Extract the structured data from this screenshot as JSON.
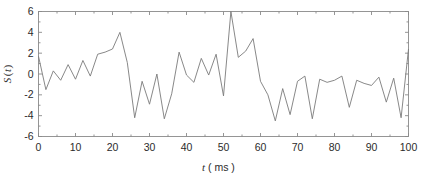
{
  "chart_data": {
    "type": "line",
    "title": "",
    "xlabel": "t ( ms )",
    "ylabel": "S ( t )",
    "xlabel_italic": "t",
    "xlabel_unit": "( ms )",
    "ylabel_italic_s": "S",
    "ylabel_italic_t": "t",
    "xlim": [
      0,
      100
    ],
    "ylim": [
      -6,
      6
    ],
    "xticks": [
      0,
      10,
      20,
      30,
      40,
      50,
      60,
      70,
      80,
      90,
      100
    ],
    "xticklabels": [
      "0",
      "10",
      "20",
      "30",
      "40",
      "50",
      "60",
      "70",
      "80",
      "90",
      "100"
    ],
    "xminorticks": [
      5,
      15,
      25,
      35,
      45,
      55,
      65,
      75,
      85,
      95
    ],
    "yticks": [
      -6,
      -4,
      -2,
      0,
      2,
      4,
      6
    ],
    "yticklabels": [
      "-6",
      "-4",
      "-2",
      "0",
      "2",
      "4",
      "6"
    ],
    "grid": false,
    "legend": null,
    "line_color": "#7a7a7a",
    "axis_color": "#8a8a8a",
    "background_color": "#ffffff",
    "series": [
      {
        "name": "S(t)",
        "x": [
          0,
          2,
          4,
          6,
          8,
          10,
          12,
          14,
          16,
          18,
          20,
          22,
          24,
          26,
          28,
          30,
          32,
          34,
          36,
          38,
          40,
          42,
          44,
          46,
          48,
          50,
          52,
          54,
          56,
          58,
          60,
          62,
          64,
          66,
          68,
          70,
          72,
          74,
          76,
          78,
          80,
          82,
          84,
          86,
          88,
          90,
          92,
          94,
          96,
          98,
          100
        ],
        "values": [
          1.7,
          -1.5,
          0.3,
          -0.6,
          0.9,
          -0.5,
          1.3,
          -0.2,
          1.9,
          2.1,
          2.4,
          4.0,
          1.1,
          -4.2,
          -0.7,
          -2.9,
          0.0,
          -4.3,
          -1.9,
          2.1,
          -0.1,
          -0.8,
          1.5,
          -0.1,
          1.9,
          -2.1,
          6.0,
          1.6,
          2.2,
          3.4,
          -0.7,
          -2.0,
          -4.5,
          -1.4,
          -3.9,
          -0.7,
          -0.2,
          -4.3,
          -0.5,
          -0.8,
          -0.6,
          -0.2,
          -3.2,
          -0.6,
          -0.9,
          -1.1,
          -0.3,
          -2.7,
          -0.4,
          -4.2,
          2.4
        ]
      }
    ]
  },
  "axis": {
    "y_label_s": "S",
    "y_label_paren_open": "(",
    "y_label_t": "t",
    "y_label_paren_close": ")",
    "x_label_t": "t",
    "x_label_unit": "( ms )"
  }
}
